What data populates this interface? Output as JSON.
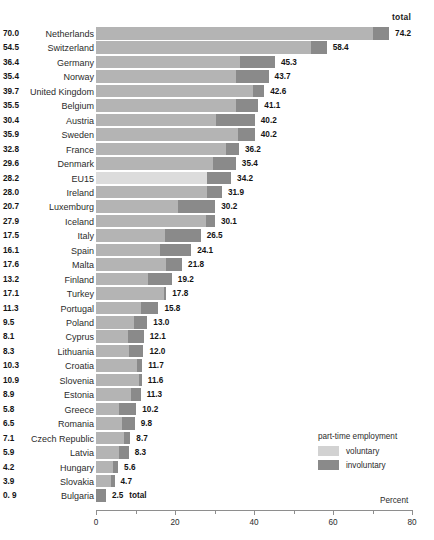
{
  "chart_data": {
    "type": "bar",
    "orientation": "horizontal",
    "stacked": true,
    "title": "",
    "subtitle": "",
    "xlabel": "Percent",
    "ylabel": "",
    "xlim": [
      0,
      80
    ],
    "xticks": [
      0,
      10,
      20,
      30,
      40,
      50,
      60,
      70,
      80
    ],
    "xticklabels": [
      "0",
      "",
      "20",
      "",
      "40",
      "",
      "60",
      "",
      "80"
    ],
    "grid": false,
    "total_header": "total",
    "total_suffix_note": "total",
    "legend": {
      "title": "part-time employment",
      "position": "bottom-right",
      "entries": [
        {
          "name": "voluntary",
          "color": "#d2d2d2"
        },
        {
          "name": "involuntary",
          "color": "#8a8a8a"
        }
      ]
    },
    "series": [
      {
        "name": "voluntary",
        "color": "#b4b4b4"
      },
      {
        "name": "involuntary",
        "color": "#8a8a8a"
      }
    ],
    "categories": [
      "Netherlands",
      "Switzerland",
      "Germany",
      "Norway",
      "United Kingdom",
      "Belgium",
      "Austria",
      "Sweden",
      "France",
      "Denmark",
      "EU15",
      "Ireland",
      "Luxemburg",
      "Iceland",
      "Italy",
      "Spain",
      "Malta",
      "Finland",
      "Turkey",
      "Portugal",
      "Poland",
      "Cyprus",
      "Lithuania",
      "Croatia",
      "Slovenia",
      "Estonia",
      "Greece",
      "Romania",
      "Czech Republic",
      "Latvia",
      "Hungary",
      "Slovakia",
      "Bulgaria"
    ],
    "rows": [
      {
        "label": "Netherlands",
        "voluntary": 70.0,
        "total": 74.2,
        "voluntary_text": "70.0",
        "total_text": "74.2",
        "highlight": false
      },
      {
        "label": "Switzerland",
        "voluntary": 54.5,
        "total": 58.4,
        "voluntary_text": "54.5",
        "total_text": "58.4",
        "highlight": false
      },
      {
        "label": "Germany",
        "voluntary": 36.4,
        "total": 45.3,
        "voluntary_text": "36.4",
        "total_text": "45.3",
        "highlight": false
      },
      {
        "label": "Norway",
        "voluntary": 35.4,
        "total": 43.7,
        "voluntary_text": "35.4",
        "total_text": "43.7",
        "highlight": false
      },
      {
        "label": "United Kingdom",
        "voluntary": 39.7,
        "total": 42.6,
        "voluntary_text": "39.7",
        "total_text": "42.6",
        "highlight": false
      },
      {
        "label": "Belgium",
        "voluntary": 35.5,
        "total": 41.1,
        "voluntary_text": "35.5",
        "total_text": "41.1",
        "highlight": false
      },
      {
        "label": "Austria",
        "voluntary": 30.4,
        "total": 40.2,
        "voluntary_text": "30.4",
        "total_text": "40.2",
        "highlight": false
      },
      {
        "label": "Sweden",
        "voluntary": 35.9,
        "total": 40.2,
        "voluntary_text": "35.9",
        "total_text": "40.2",
        "highlight": false
      },
      {
        "label": "France",
        "voluntary": 32.8,
        "total": 36.2,
        "voluntary_text": "32.8",
        "total_text": "36.2",
        "highlight": false
      },
      {
        "label": "Denmark",
        "voluntary": 29.6,
        "total": 35.4,
        "voluntary_text": "29.6",
        "total_text": "35.4",
        "highlight": false
      },
      {
        "label": "EU15",
        "voluntary": 28.2,
        "total": 34.2,
        "voluntary_text": "28.2",
        "total_text": "34.2",
        "highlight": true
      },
      {
        "label": "Ireland",
        "voluntary": 28.0,
        "total": 31.9,
        "voluntary_text": "28.0",
        "total_text": "31.9",
        "highlight": false
      },
      {
        "label": "Luxemburg",
        "voluntary": 20.7,
        "total": 30.2,
        "voluntary_text": "20.7",
        "total_text": "30.2",
        "highlight": false
      },
      {
        "label": "Iceland",
        "voluntary": 27.9,
        "total": 30.1,
        "voluntary_text": "27.9",
        "total_text": "30.1",
        "highlight": false
      },
      {
        "label": "Italy",
        "voluntary": 17.5,
        "total": 26.5,
        "voluntary_text": "17.5",
        "total_text": "26.5",
        "highlight": false
      },
      {
        "label": "Spain",
        "voluntary": 16.1,
        "total": 24.1,
        "voluntary_text": "16.1",
        "total_text": "24.1",
        "highlight": false
      },
      {
        "label": "Malta",
        "voluntary": 17.6,
        "total": 21.8,
        "voluntary_text": "17.6",
        "total_text": "21.8",
        "highlight": false
      },
      {
        "label": "Finland",
        "voluntary": 13.2,
        "total": 19.2,
        "voluntary_text": "13.2",
        "total_text": "19.2",
        "highlight": false
      },
      {
        "label": "Turkey",
        "voluntary": 17.1,
        "total": 17.8,
        "voluntary_text": "17.1",
        "total_text": "17.8",
        "highlight": false
      },
      {
        "label": "Portugal",
        "voluntary": 11.3,
        "total": 15.8,
        "voluntary_text": "11.3",
        "total_text": "15.8",
        "highlight": false
      },
      {
        "label": "Poland",
        "voluntary": 9.5,
        "total": 13.0,
        "voluntary_text": "9.5",
        "total_text": "13.0",
        "highlight": false
      },
      {
        "label": "Cyprus",
        "voluntary": 8.1,
        "total": 12.1,
        "voluntary_text": "8.1",
        "total_text": "12.1",
        "highlight": false
      },
      {
        "label": "Lithuania",
        "voluntary": 8.3,
        "total": 12.0,
        "voluntary_text": "8.3",
        "total_text": "12.0",
        "highlight": false
      },
      {
        "label": "Croatia",
        "voluntary": 10.3,
        "total": 11.7,
        "voluntary_text": "10.3",
        "total_text": "11.7",
        "highlight": false
      },
      {
        "label": "Slovenia",
        "voluntary": 10.9,
        "total": 11.6,
        "voluntary_text": "10.9",
        "total_text": "11.6",
        "highlight": false
      },
      {
        "label": "Estonia",
        "voluntary": 8.9,
        "total": 11.3,
        "voluntary_text": "8.9",
        "total_text": "11.3",
        "highlight": false
      },
      {
        "label": "Greece",
        "voluntary": 5.8,
        "total": 10.2,
        "voluntary_text": "5.8",
        "total_text": "10.2",
        "highlight": false
      },
      {
        "label": "Romania",
        "voluntary": 6.5,
        "total": 9.8,
        "voluntary_text": "6.5",
        "total_text": "9.8",
        "highlight": false
      },
      {
        "label": "Czech Republic",
        "voluntary": 7.1,
        "total": 8.7,
        "voluntary_text": "7.1",
        "total_text": "8.7",
        "highlight": false
      },
      {
        "label": "Latvia",
        "voluntary": 5.9,
        "total": 8.3,
        "voluntary_text": "5.9",
        "total_text": "8.3",
        "highlight": false
      },
      {
        "label": "Hungary",
        "voluntary": 4.2,
        "total": 5.6,
        "voluntary_text": "4.2",
        "total_text": "5.6",
        "highlight": false
      },
      {
        "label": "Slovakia",
        "voluntary": 3.9,
        "total": 4.7,
        "voluntary_text": "3.9",
        "total_text": "4.7",
        "highlight": false
      },
      {
        "label": "Bulgaria",
        "voluntary": 0.0,
        "total": 2.5,
        "voluntary_text": "0. 9",
        "total_text": "2.5",
        "highlight": false,
        "total_suffix": "total"
      }
    ]
  }
}
